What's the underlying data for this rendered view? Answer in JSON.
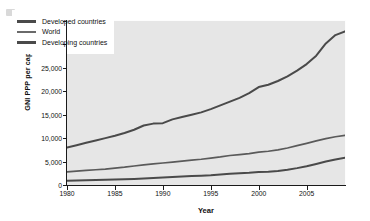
{
  "chart_data": {
    "type": "line",
    "title": "",
    "xlabel": "Year",
    "ylabel": "GNI PPP per capita ( US $)",
    "xlim": [
      1980,
      2009
    ],
    "ylim": [
      0,
      35000
    ],
    "xticks": [
      "1980",
      "1985",
      "1990",
      "1995",
      "2000",
      "2005"
    ],
    "xtick_values": [
      1980,
      1985,
      1990,
      1995,
      2000,
      2005
    ],
    "yticks": [
      "0",
      "5,000",
      "10,000",
      "15,000",
      "20,000",
      "25,000",
      "30,000",
      "35,000"
    ],
    "ytick_values": [
      0,
      5000,
      10000,
      15000,
      20000,
      25000,
      30000,
      35000
    ],
    "grid": false,
    "legend_position": "top-left-inside",
    "x": [
      1980,
      1981,
      1982,
      1983,
      1984,
      1985,
      1986,
      1987,
      1988,
      1989,
      1990,
      1991,
      1992,
      1993,
      1994,
      1995,
      1996,
      1997,
      1998,
      1999,
      2000,
      2001,
      2002,
      2003,
      2004,
      2005,
      2006,
      2007,
      2008,
      2009
    ],
    "series": [
      {
        "name": "Developed countries",
        "color": "#4a4a4a",
        "values": [
          8000,
          8500,
          9000,
          9500,
          10000,
          10500,
          11100,
          11800,
          12700,
          13100,
          13200,
          14000,
          14500,
          15000,
          15500,
          16200,
          17000,
          17800,
          18600,
          19600,
          20900,
          21400,
          22200,
          23200,
          24400,
          25800,
          27600,
          30200,
          32000,
          32800
        ]
      },
      {
        "name": "World",
        "color": "#5a5a5a",
        "values": [
          2800,
          2950,
          3100,
          3250,
          3400,
          3600,
          3800,
          4050,
          4300,
          4500,
          4700,
          4900,
          5100,
          5300,
          5500,
          5750,
          6000,
          6300,
          6500,
          6700,
          7000,
          7200,
          7500,
          7900,
          8400,
          8900,
          9400,
          9900,
          10300,
          10600
        ]
      },
      {
        "name": "Developing countries",
        "color": "#4a4a4a",
        "values": [
          900,
          950,
          1000,
          1050,
          1100,
          1150,
          1220,
          1300,
          1400,
          1500,
          1600,
          1700,
          1800,
          1900,
          2000,
          2100,
          2250,
          2400,
          2500,
          2600,
          2750,
          2850,
          3000,
          3250,
          3600,
          4000,
          4500,
          5000,
          5450,
          5800
        ]
      }
    ]
  },
  "legend": {
    "items": [
      {
        "label": "Developed countries"
      },
      {
        "label": "World"
      },
      {
        "label": "Developing countries"
      }
    ]
  }
}
